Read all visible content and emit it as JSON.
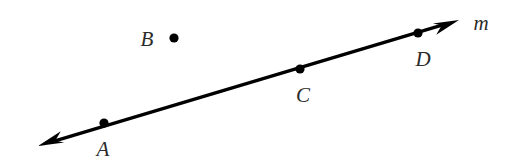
{
  "figure": {
    "type": "geometry-line-diagram",
    "background_color": "#ffffff",
    "stroke_color": "#000000",
    "label_color": "#2b2b2b",
    "width": 515,
    "height": 167
  },
  "line": {
    "name": "m",
    "label": "m",
    "label_x": 481,
    "label_y": 23,
    "start_x": 38,
    "start_y": 146,
    "end_x": 459,
    "end_y": 20,
    "stroke_width": 3.2,
    "arrow_start": true,
    "arrow_end": true
  },
  "points": [
    {
      "label": "A",
      "x": 104,
      "y": 123,
      "on_line": true,
      "dot_radius": 4.6,
      "label_x": 103,
      "label_y": 149
    },
    {
      "label": "B",
      "x": 174,
      "y": 38,
      "on_line": false,
      "dot_radius": 4.6,
      "label_x": 147,
      "label_y": 39
    },
    {
      "label": "C",
      "x": 300,
      "y": 69,
      "on_line": true,
      "dot_radius": 4.6,
      "label_x": 303,
      "label_y": 95
    },
    {
      "label": "D",
      "x": 418,
      "y": 33,
      "on_line": true,
      "dot_radius": 4.6,
      "label_x": 423,
      "label_y": 59
    }
  ]
}
